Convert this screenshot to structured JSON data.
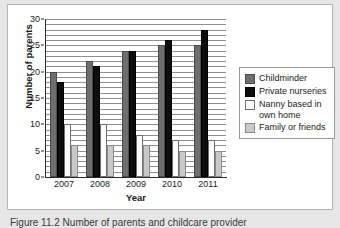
{
  "chart_data": {
    "type": "bar",
    "title": "",
    "xlabel": "Year",
    "ylabel": "Number of parents",
    "categories": [
      "2007",
      "2008",
      "2009",
      "2010",
      "2011"
    ],
    "ylim": [
      0,
      30
    ],
    "yticks": [
      0,
      5,
      10,
      15,
      20,
      25,
      30
    ],
    "grid": "horizontal-minor",
    "legend_position": "right",
    "series": [
      {
        "name": "Childminder",
        "color": "#6e6e6e",
        "values": [
          20,
          22,
          24,
          25,
          25
        ]
      },
      {
        "name": "Private nurseries",
        "color": "#0d0d0d",
        "values": [
          18,
          21,
          24,
          26,
          28
        ]
      },
      {
        "name": "Nanny based in\nown home",
        "color": "#fbfbfb",
        "values": [
          10,
          10,
          8,
          7,
          7
        ]
      },
      {
        "name": "Family or friends",
        "color": "#c9c9c9",
        "values": [
          6,
          6,
          6,
          5,
          5
        ]
      }
    ]
  },
  "caption": {
    "text": "Figure 11.2 Number of parents and childcare provider"
  }
}
